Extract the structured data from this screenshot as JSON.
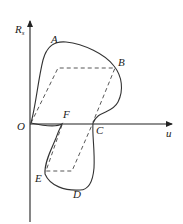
{
  "diagram": {
    "type": "hysteresis-loop",
    "axes": {
      "y_label": "R",
      "y_label_subscript": "s",
      "x_label": "u",
      "origin_label": "O"
    },
    "points": [
      {
        "id": "A",
        "label": "A"
      },
      {
        "id": "B",
        "label": "B"
      },
      {
        "id": "C",
        "label": "C"
      },
      {
        "id": "D",
        "label": "D"
      },
      {
        "id": "E",
        "label": "E"
      },
      {
        "id": "F",
        "label": "F"
      }
    ],
    "colors": {
      "curve": "#333333",
      "axis": "#222222",
      "dashed": "#444444",
      "background": "#ffffff"
    }
  }
}
